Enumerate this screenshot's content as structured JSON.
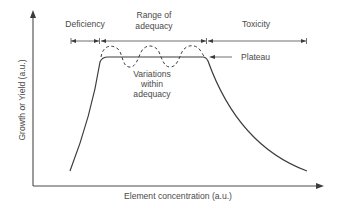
{
  "diagram": {
    "title": "",
    "x_axis_label": "Element concentration (a.u.)",
    "y_axis_label": "Growth or Yield (a.u.)",
    "zones": [
      {
        "id": "deficiency",
        "label_lines": [
          "Deficiency"
        ]
      },
      {
        "id": "adequacy",
        "label_lines": [
          "Range of",
          "adequacy"
        ]
      },
      {
        "id": "toxicity",
        "label_lines": [
          "Toxicity"
        ]
      }
    ],
    "annotations": {
      "plateau": "Plateau",
      "variations": [
        "Variations",
        "within",
        "adequacy"
      ]
    },
    "colors": {
      "line": "#3c3c3c",
      "text": "#4a4a4a",
      "background": "#ffffff"
    }
  }
}
